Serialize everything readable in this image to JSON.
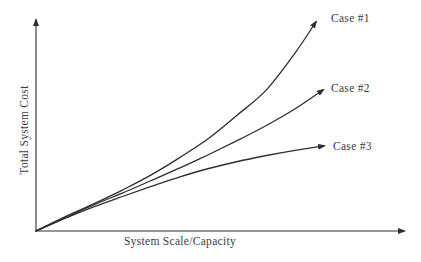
{
  "figure": {
    "background": "#ffffff",
    "line_color": "#2e2e2e",
    "text_color": "#3c3c3c"
  },
  "chart_data": {
    "type": "line",
    "title": "",
    "xlabel": "System Scale/Capacity",
    "ylabel": "Total System Cost",
    "x_ticks": [],
    "y_ticks": [],
    "grid": false,
    "axes_have_arrowheads": true,
    "legend_position": "labels at line ends, right side",
    "xlim": [
      0,
      10.8
    ],
    "ylim": [
      0,
      10.5
    ],
    "series": [
      {
        "name": "Case #1",
        "trend": "superlinear - cost accelerates upward with scale",
        "x": [
          0,
          1,
          2,
          3,
          4,
          5,
          6,
          7,
          8,
          9,
          9.72
        ],
        "y": [
          0,
          0.66,
          1.27,
          1.92,
          2.63,
          3.45,
          4.35,
          5.45,
          6.62,
          8.36,
          9.81
        ]
      },
      {
        "name": "Case #2",
        "trend": "approximately linear growth",
        "x": [
          0,
          1,
          2,
          3,
          4,
          5,
          6,
          7,
          8,
          9,
          9.97
        ],
        "y": [
          0,
          0.61,
          1.22,
          1.78,
          2.37,
          2.96,
          3.59,
          4.25,
          4.95,
          5.73,
          6.62
        ]
      },
      {
        "name": "Case #3",
        "trend": "sublinear - cost growth flattens with scale",
        "x": [
          0,
          1,
          2,
          3,
          4,
          5,
          6,
          7,
          8,
          9,
          10
        ],
        "y": [
          0,
          0.59,
          1.13,
          1.62,
          2.09,
          2.54,
          2.93,
          3.26,
          3.54,
          3.78,
          3.99
        ]
      }
    ]
  }
}
